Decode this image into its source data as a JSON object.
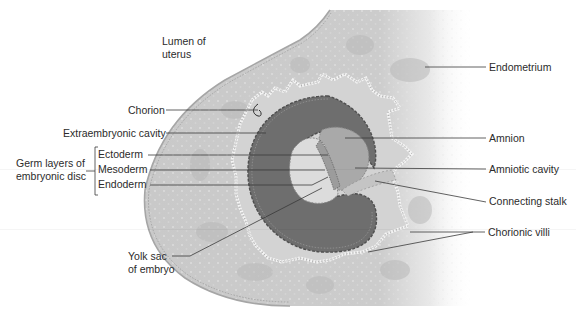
{
  "diagram": {
    "type": "anatomical-cross-section",
    "colors": {
      "background": "#ffffff",
      "endometrium": "#c9c9c9",
      "endometrium_glands": "#b7b7b7",
      "chorion_villi_outline": "#f2f2f2",
      "extraembryonic_cavity": "#6e6e6e",
      "amnion": "#a9a9a9",
      "yolk_sac": "#dcdcdc",
      "label_text": "#2b2b2b",
      "leader_line": "#3a3a3a"
    },
    "labels": {
      "lumen": {
        "line1": "Lumen of",
        "line2": "uterus"
      },
      "endometrium": "Endometrium",
      "chorion": "Chorion",
      "extraembryonic_cavity": "Extraembryonic cavity",
      "amnion": "Amnion",
      "germ_layers": {
        "line1": "Germ layers of",
        "line2": "embryonic disc"
      },
      "ectoderm": "Ectoderm",
      "mesoderm": "Mesoderm",
      "endoderm": "Endoderm",
      "amniotic_cavity": "Amniotic cavity",
      "connecting_stalk": "Connecting stalk",
      "chorionic_villi": "Chorionic villi",
      "yolk_sac": {
        "line1": "Yolk sac",
        "line2": "of embryo"
      }
    }
  }
}
